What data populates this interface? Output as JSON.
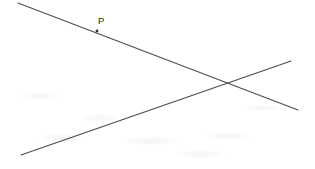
{
  "figure": {
    "canvas": {
      "width": 315,
      "height": 169
    },
    "background_color": "#ffffff",
    "line_color": "#4a4a4a",
    "point_color": "#303030",
    "label_color": "#1d1d1d",
    "lines": [
      {
        "id": "descending-line",
        "name": "Descending line through P",
        "x1": 18,
        "y1": 3,
        "x2": 298,
        "y2": 110
      },
      {
        "id": "ascending-line",
        "name": "Ascending line",
        "x1": 21,
        "y1": 155,
        "x2": 291,
        "y2": 61
      }
    ],
    "points": [
      {
        "id": "point-p",
        "label": "P",
        "x": 97,
        "y": 31,
        "radius": 1.4,
        "label_x": 98,
        "label_y": 24
      }
    ],
    "intersection": {
      "id": "intersection-point",
      "label": "",
      "x": 228,
      "y": 82
    }
  }
}
